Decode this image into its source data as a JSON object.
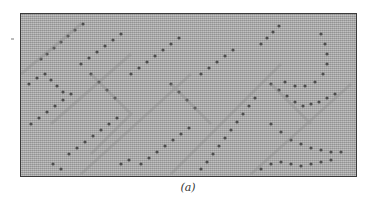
{
  "figure": {
    "caption": "(a)",
    "frame_color": "#3a3a3a",
    "fabric_color": "#a9a9a9",
    "eyelet_color": "#2e2e2e"
  }
}
